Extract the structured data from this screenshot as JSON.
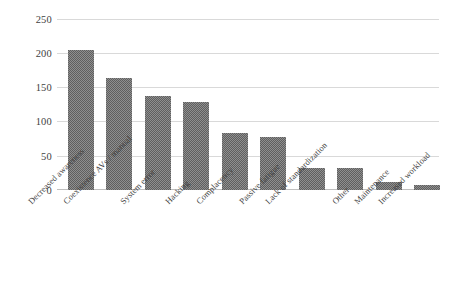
{
  "chart_data": {
    "type": "bar",
    "title": "",
    "subtitle": "",
    "xlabel": "",
    "ylabel": "",
    "ylim": [
      0,
      250
    ],
    "yticks": [
      0,
      50,
      100,
      150,
      200,
      250
    ],
    "grid": true,
    "legend": false,
    "legend_position": "none",
    "bar_color": "#5f5f5f",
    "gridline_color": "#d9d9d9",
    "categories": [
      "Decreased awareness",
      "Coexistence AVs / manual",
      "System error",
      "Hacking",
      "Complacency",
      "Passive fatigue",
      "Lack of standardization",
      "Other",
      "Maintenance",
      "Increased workload"
    ],
    "values": [
      204,
      164,
      137,
      128,
      84,
      77,
      32,
      32,
      11,
      7
    ],
    "series": [
      {
        "name": "Count",
        "values": [
          204,
          164,
          137,
          128,
          84,
          77,
          32,
          32,
          11,
          7
        ]
      }
    ]
  }
}
